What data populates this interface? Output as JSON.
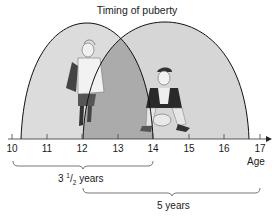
{
  "title": "Timing of puberty",
  "axis": {
    "label": "Age",
    "ticks": [
      "10",
      "11",
      "12",
      "13",
      "14",
      "15",
      "16",
      "17"
    ]
  },
  "groups": [
    {
      "name": "girls",
      "illustration": "girl-figure",
      "start_age": 10.25,
      "end_age": 14,
      "fill": "#d9d9d9"
    },
    {
      "name": "boys",
      "illustration": "boy-figure",
      "start_age": 12,
      "end_age": 16.7,
      "fill": "#d4d4d4"
    }
  ],
  "overlap_fill": "#a9a9a9",
  "brackets": [
    {
      "from": "10",
      "to": "14",
      "label_whole": "3",
      "label_num": "1",
      "label_den": "2",
      "label_unit": "years"
    },
    {
      "from": "12",
      "to": "17",
      "label": "5 years"
    }
  ]
}
